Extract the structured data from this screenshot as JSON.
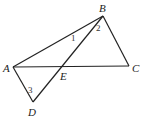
{
  "diagram": {
    "points": {
      "A": {
        "label": "A",
        "x": 13,
        "y": 67
      },
      "B": {
        "label": "B",
        "x": 103,
        "y": 16
      },
      "C": {
        "label": "C",
        "x": 129,
        "y": 66
      },
      "D": {
        "label": "D",
        "x": 33,
        "y": 102
      },
      "E": {
        "label": "E",
        "x": 62,
        "y": 67
      }
    },
    "segments": [
      "AB",
      "BC",
      "AC",
      "BD",
      "AD"
    ],
    "angles": [
      {
        "label": "1",
        "at": "B",
        "between": "AB, BD (on AB side)"
      },
      {
        "label": "2",
        "at": "B",
        "between": "BD, BC"
      },
      {
        "label": "3",
        "at": "D",
        "between": "DA, DB"
      }
    ],
    "colors": {
      "stroke": "#222222",
      "background": "#ffffff"
    }
  }
}
